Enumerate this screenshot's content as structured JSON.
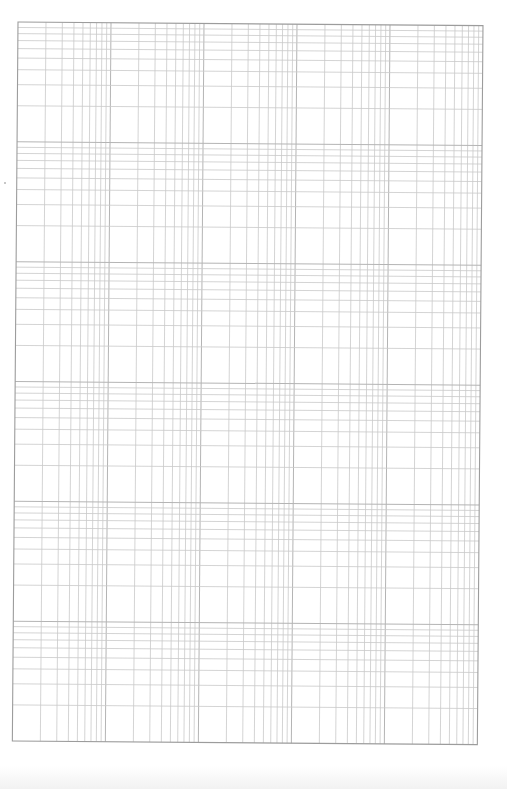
{
  "sheet": {
    "type": "log-log graph paper",
    "x_axis": {
      "decades": 5,
      "direction": "increasing-right",
      "minor_steps": [
        1,
        2,
        3,
        4,
        5,
        6,
        7,
        8,
        9,
        10
      ]
    },
    "y_axis": {
      "decades": 6,
      "direction": "increasing-up",
      "minor_steps": [
        1,
        2,
        3,
        4,
        5,
        6,
        7,
        8,
        9,
        10
      ]
    },
    "frame": {
      "left": 18,
      "top": 22,
      "width": 465,
      "height": 719,
      "rotation_deg": 0.45
    },
    "colors": {
      "background": "#ffffff",
      "grid_line": "#c9c9c9",
      "decade_line": "#b4b4b4",
      "border": "#9c9c9c",
      "speck": "#b5b5b5"
    },
    "line_widths": {
      "grid": 0.8,
      "decade": 1.0,
      "border": 1.1
    }
  }
}
